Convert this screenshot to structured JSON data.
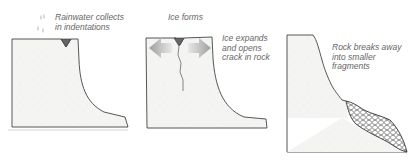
{
  "stages": [
    {
      "id": "stage-1",
      "label": "Rainwater collects\nin indentations",
      "icon": "raindrops-icon"
    },
    {
      "id": "stage-2",
      "top_label": "Ice forms",
      "label": "Ice expands\nand opens\ncrack in rock",
      "icon": "expansion-arrows-icon"
    },
    {
      "id": "stage-3",
      "label": "Rock breaks away\ninto smaller\nfragments",
      "icon": "rock-fragments-icon"
    }
  ],
  "colors": {
    "rock_fill": "#f4f4f2",
    "outline": "#444444",
    "water": "#777777",
    "arrow": "#b5b5b5",
    "text": "#666666"
  }
}
